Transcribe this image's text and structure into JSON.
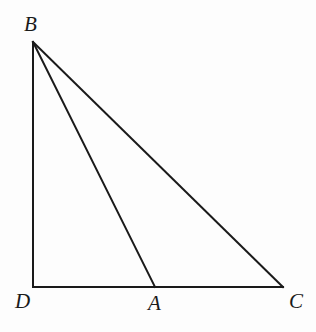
{
  "figure": {
    "kind": "geometry-diagram",
    "background_color": "#fdfdfd",
    "stroke_color": "#1a1a1a",
    "stroke_width": 2,
    "canvas": {
      "width": 316,
      "height": 332
    },
    "points": [
      {
        "id": "B",
        "label": "B",
        "x": 33,
        "y": 42,
        "label_x": 24,
        "label_y": 14
      },
      {
        "id": "D",
        "label": "D",
        "x": 33,
        "y": 287,
        "label_x": 15,
        "label_y": 291
      },
      {
        "id": "A",
        "label": "A",
        "x": 155,
        "y": 287,
        "label_x": 148,
        "label_y": 293
      },
      {
        "id": "C",
        "label": "C",
        "x": 283,
        "y": 287,
        "label_x": 289,
        "label_y": 291
      }
    ],
    "segments": [
      {
        "id": "BD",
        "name": "segment-bd",
        "from": "B",
        "to": "D",
        "x1": 33,
        "y1": 42,
        "x2": 33,
        "y2": 287
      },
      {
        "id": "DC",
        "name": "segment-dc",
        "from": "D",
        "to": "C",
        "x1": 33,
        "y1": 287,
        "x2": 283,
        "y2": 287
      },
      {
        "id": "BA",
        "name": "segment-ba",
        "from": "B",
        "to": "A",
        "x1": 33,
        "y1": 42,
        "x2": 155,
        "y2": 287
      },
      {
        "id": "BC",
        "name": "segment-bc",
        "from": "B",
        "to": "C",
        "x1": 33,
        "y1": 42,
        "x2": 283,
        "y2": 287
      }
    ]
  }
}
